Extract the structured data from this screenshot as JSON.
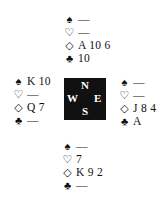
{
  "compass": {
    "north": "N",
    "west": "W",
    "east": "E",
    "south": "S",
    "background": "#111111",
    "text_color": "#ffffff"
  },
  "suits": {
    "spade": "♠",
    "heart": "♡",
    "diamond": "◇",
    "club": "♣"
  },
  "hands": {
    "north": {
      "spades": "—",
      "hearts": "—",
      "diamonds": "A 10 6",
      "clubs": "10"
    },
    "west": {
      "spades": "K 10",
      "hearts": "—",
      "diamonds": "Q 7",
      "clubs": "—"
    },
    "east": {
      "spades": "—",
      "hearts": "—",
      "diamonds": "J 8 4",
      "clubs": "A"
    },
    "south": {
      "spades": "—",
      "hearts": "7",
      "diamonds": "K 9 2",
      "clubs": "—"
    }
  }
}
